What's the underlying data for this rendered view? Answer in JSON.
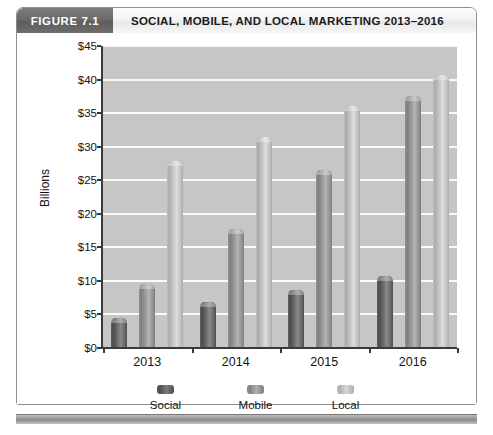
{
  "figure": {
    "tag": "FIGURE 7.1",
    "title": "SOCIAL, MOBILE, AND LOCAL MARKETING 2013–2016"
  },
  "chart_data": {
    "type": "bar",
    "title": "SOCIAL, MOBILE, AND LOCAL MARKETING 2013–2016",
    "xlabel": "",
    "ylabel": "Billions",
    "categories": [
      "2013",
      "2014",
      "2015",
      "2016"
    ],
    "series": [
      {
        "name": "Social",
        "color": "#5c5c5c",
        "values": [
          4.5,
          6.8,
          8.7,
          10.7
        ]
      },
      {
        "name": "Mobile",
        "color": "#909090",
        "values": [
          9.6,
          17.8,
          26.5,
          37.5
        ]
      },
      {
        "name": "Local",
        "color": "#c2c2c2",
        "values": [
          27.8,
          31.5,
          36.0,
          40.7
        ]
      }
    ],
    "ylim": [
      0,
      45
    ],
    "ytick_values": [
      0,
      5,
      10,
      15,
      20,
      25,
      30,
      35,
      40,
      45
    ],
    "ytick_labels": [
      "$0",
      "$5",
      "$10",
      "$15",
      "$20",
      "$25",
      "$30",
      "$35",
      "$40",
      "$45"
    ],
    "grid": true,
    "legend_position": "bottom",
    "plot_background": "#c6c6c6",
    "gridline_color": "#fafafa"
  }
}
